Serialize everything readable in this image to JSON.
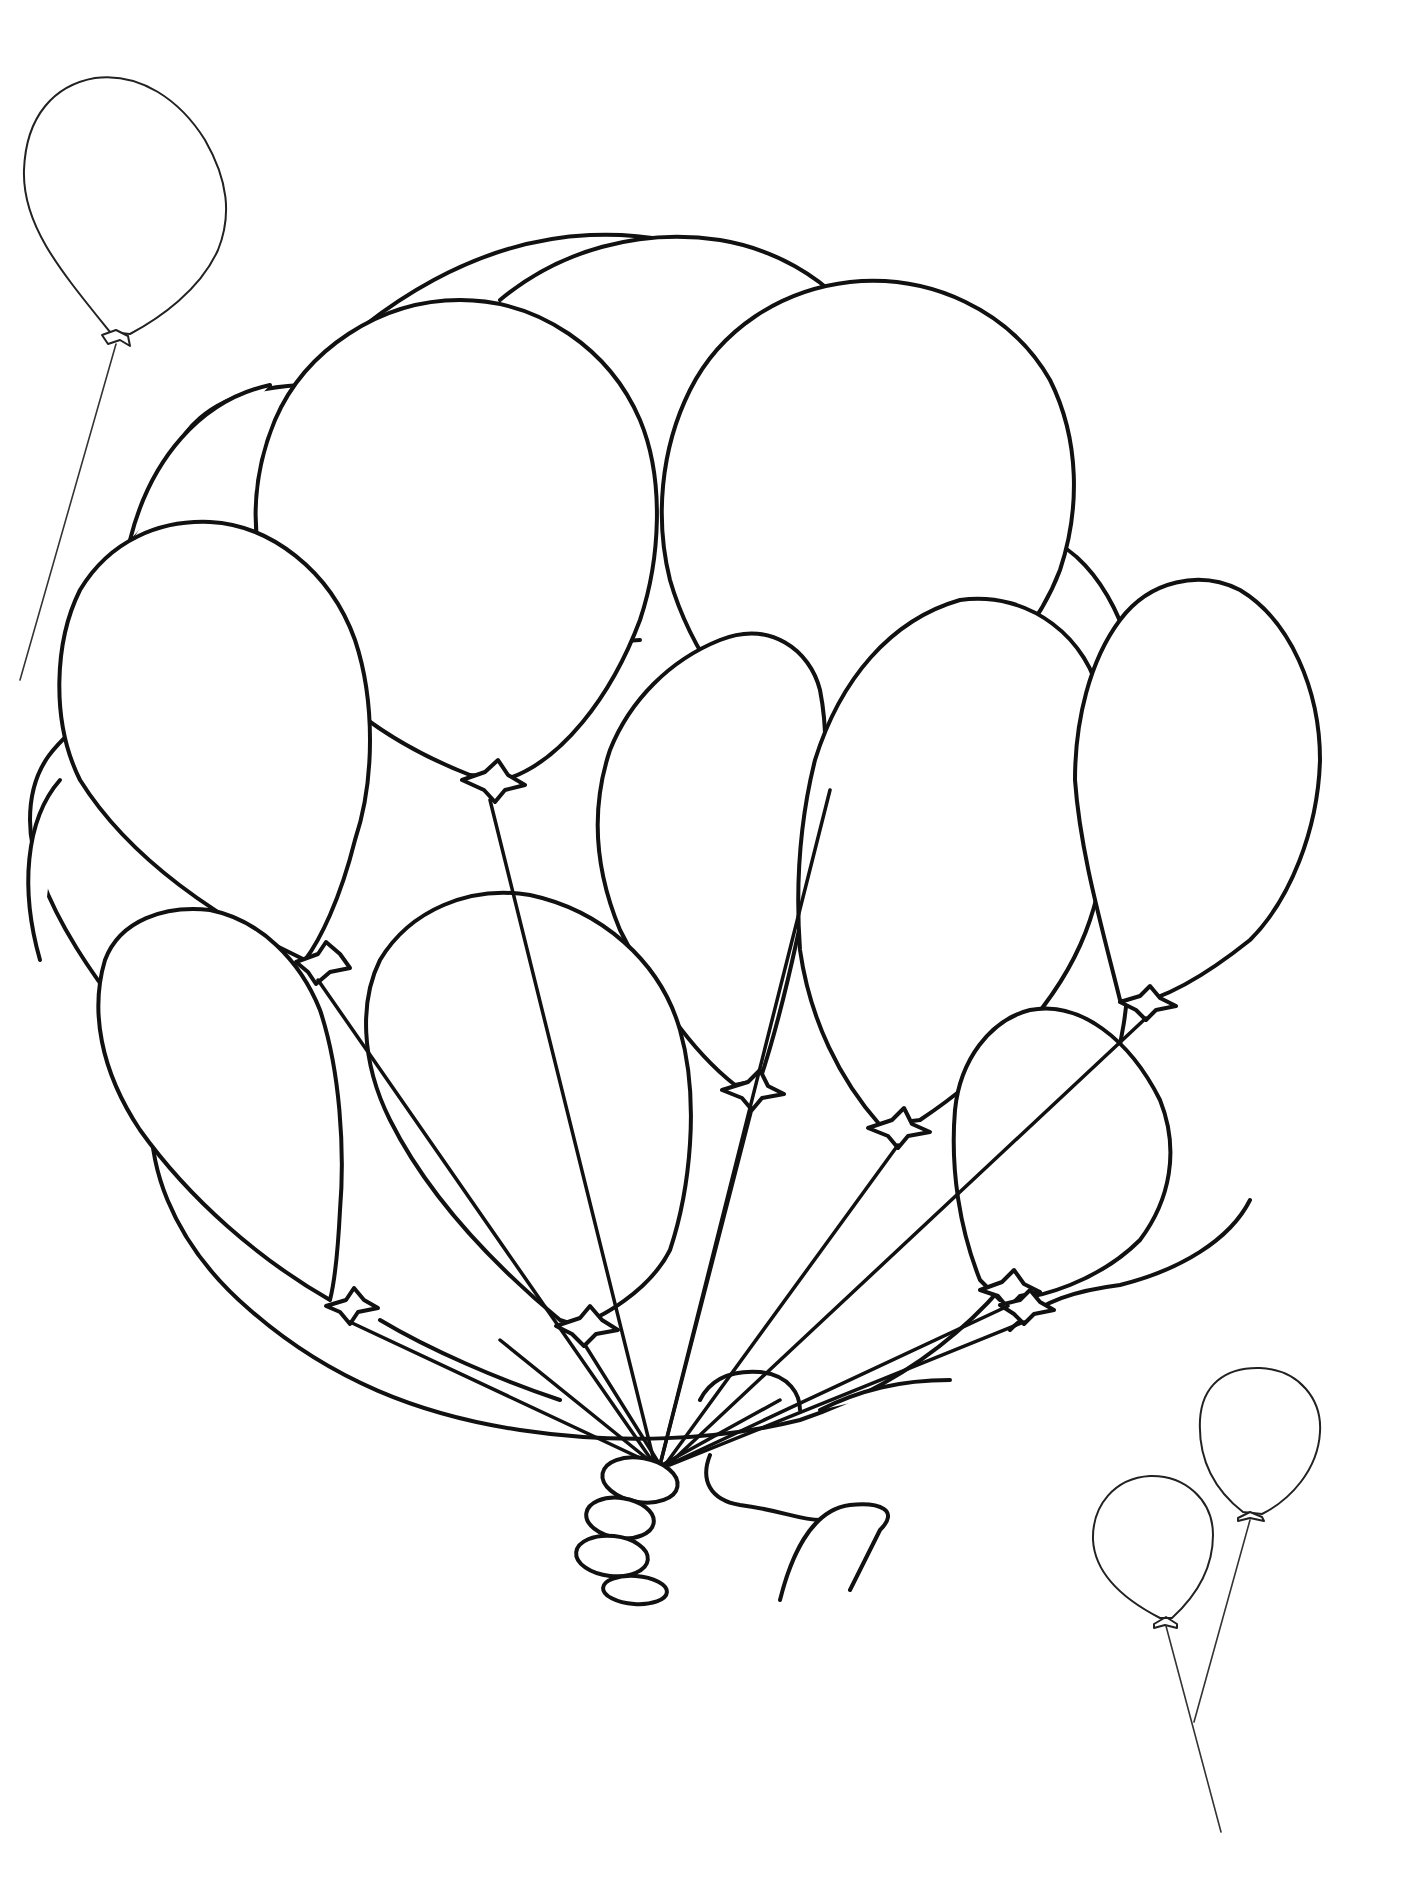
{
  "page": {
    "type": "coloring-page",
    "background": "#ffffff",
    "line_color": "#111111"
  },
  "loose_balloons": [
    {
      "name": "top-left-balloon",
      "cx": 125,
      "cy": 210,
      "rx": 102,
      "ry": 125,
      "knot": [
        115,
        338
      ],
      "string_end": [
        20,
        680
      ]
    },
    {
      "name": "bottom-right-balloon-back",
      "cx": 1260,
      "cy": 1430,
      "rx": 60,
      "ry": 75,
      "knot": [
        1243,
        1516
      ],
      "string_end": [
        1195,
        1720
      ]
    },
    {
      "name": "bottom-right-balloon-front",
      "cx": 1147,
      "cy": 1535,
      "rx": 62,
      "ry": 72,
      "knot": [
        1163,
        1622
      ],
      "string_end": [
        1220,
        1830
      ]
    }
  ],
  "bunch": {
    "outline_center": [
      706,
      1030
    ],
    "hand_position": [
      640,
      1440
    ],
    "balloon_count": 17
  }
}
